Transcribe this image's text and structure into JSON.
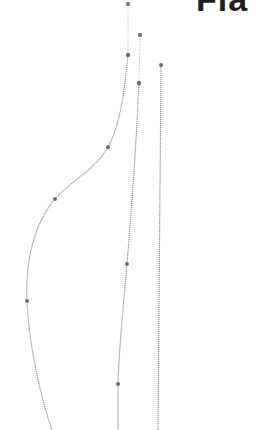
{
  "heading": {
    "text": "Fla"
  },
  "colors": {
    "stroke": "#8a8a8a",
    "handle": "#bdbdbd",
    "point": "#6e6e6e",
    "text": "#1e1e1e"
  },
  "curves": [
    {
      "name": "left-curve",
      "points": [
        [
          128,
          55
        ],
        [
          108,
          147
        ],
        [
          55,
          199
        ],
        [
          27,
          301
        ],
        [
          52,
          430
        ]
      ],
      "handle_top": [
        128,
        4
      ]
    },
    {
      "name": "middle-curve",
      "points": [
        [
          139,
          83
        ],
        [
          127,
          264
        ],
        [
          118,
          384
        ],
        [
          118,
          430
        ]
      ],
      "handle_top": [
        140,
        35
      ]
    },
    {
      "name": "right-line",
      "points": [
        [
          161,
          65
        ],
        [
          158,
          430
        ]
      ]
    }
  ]
}
